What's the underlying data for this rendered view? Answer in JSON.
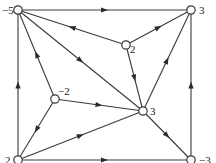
{
  "figure": {
    "caption": "Figure 10.14",
    "line_color": "#3a3a3a",
    "node_fill": "#ffffff"
  },
  "nodes": [
    {
      "id": "A",
      "x": 18,
      "y": 10,
      "value": "−5",
      "label_dx": -16,
      "label_dy": 4
    },
    {
      "id": "B",
      "x": 191,
      "y": 10,
      "value": "3",
      "label_dx": 8,
      "label_dy": 4
    },
    {
      "id": "C",
      "x": 126,
      "y": 45,
      "value": "2",
      "label_dx": 4,
      "label_dy": 8
    },
    {
      "id": "D",
      "x": 55,
      "y": 99,
      "value": "−2",
      "label_dx": 3,
      "label_dy": -4
    },
    {
      "id": "E",
      "x": 143,
      "y": 111,
      "value": "3",
      "label_dx": 7,
      "label_dy": 4
    },
    {
      "id": "F",
      "x": 18,
      "y": 160,
      "value": "2",
      "label_dx": -13,
      "label_dy": 4
    },
    {
      "id": "G",
      "x": 191,
      "y": 160,
      "value": "−3",
      "label_dx": 8,
      "label_dy": 4
    }
  ],
  "edges": [
    {
      "from": "A",
      "to": "B"
    },
    {
      "from": "F",
      "to": "A"
    },
    {
      "from": "G",
      "to": "B"
    },
    {
      "from": "F",
      "to": "G"
    },
    {
      "from": "C",
      "to": "A"
    },
    {
      "from": "A",
      "to": "E"
    },
    {
      "from": "D",
      "to": "A"
    },
    {
      "from": "C",
      "to": "B"
    },
    {
      "from": "E",
      "to": "B"
    },
    {
      "from": "C",
      "to": "E"
    },
    {
      "from": "D",
      "to": "E"
    },
    {
      "from": "D",
      "to": "F"
    },
    {
      "from": "F",
      "to": "E"
    },
    {
      "from": "E",
      "to": "G"
    }
  ]
}
